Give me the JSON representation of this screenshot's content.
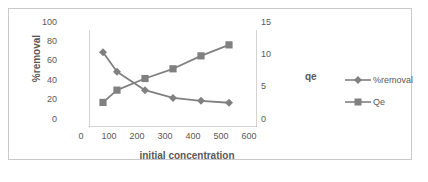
{
  "chart_data": {
    "type": "line",
    "title": "",
    "xlabel": "initial concentration",
    "ylabel": "%removal",
    "y2label": "qe",
    "x": [
      50,
      100,
      200,
      300,
      400,
      500
    ],
    "xlim": [
      0,
      600
    ],
    "xticks": [
      "0",
      "100",
      "200",
      "300",
      "400",
      "500",
      "600"
    ],
    "ylim": [
      0,
      100
    ],
    "yticks": [
      "0",
      "20",
      "40",
      "60",
      "80",
      "100"
    ],
    "y2lim": [
      0,
      15
    ],
    "y2ticks": [
      "0",
      "5",
      "10",
      "15"
    ],
    "grid": false,
    "legend_position": "right",
    "series": [
      {
        "name": "%removal",
        "axis": "left",
        "marker": "diamond",
        "color": "#808080",
        "values": [
          77,
          57,
          38,
          30,
          27,
          25
        ]
      },
      {
        "name": "Qe",
        "axis": "right",
        "marker": "square",
        "color": "#808080",
        "values": [
          3.8,
          5.7,
          7.5,
          9.0,
          11.0,
          12.7
        ]
      }
    ]
  },
  "legend": {
    "items": [
      {
        "label": "%removal",
        "marker": "diamond-marker-icon"
      },
      {
        "label": "Qe",
        "marker": "square-marker-icon"
      }
    ]
  },
  "colors": {
    "series": "#808080",
    "axis": "#a6a6a6",
    "text": "#595959",
    "frame": "#c9c9c9",
    "background": "#ffffff"
  }
}
